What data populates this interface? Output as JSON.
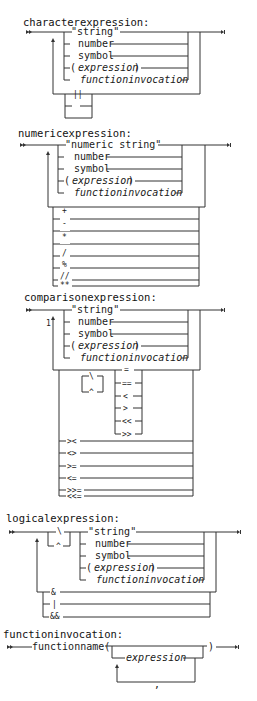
{
  "diagrams": {
    "character": {
      "title": "characterexpression:",
      "operands": [
        "\"string\"",
        "number",
        "symbol",
        "(",
        "expression",
        ")",
        "functioninvocation"
      ],
      "operators": [
        "||",
        "",
        ""
      ]
    },
    "numeric": {
      "title": "numericexpression:",
      "operands": [
        "\"numeric string\"",
        "number",
        "symbol",
        "(",
        "expression",
        ")",
        "functioninvocation"
      ],
      "operators": [
        "+",
        "-",
        "*",
        "/",
        "%",
        "//",
        "**"
      ]
    },
    "comparison": {
      "title": "comparisonexpression:",
      "note": "1",
      "operands": [
        "\"string\"",
        "number",
        "symbol",
        "(",
        "expression",
        ")",
        "functioninvocation"
      ],
      "negation": [
        "\\",
        "^"
      ],
      "operators_inner": [
        "=",
        "==",
        "<",
        ">",
        "<<",
        ">>"
      ],
      "operators_outer": [
        "><",
        "<>",
        ">=",
        "<=",
        ">>=",
        "<<="
      ]
    },
    "logical": {
      "title": "logicalexpression:",
      "negation": [
        "\\",
        "^"
      ],
      "operands": [
        "\"string\"",
        "number",
        "symbol",
        "(",
        "expression",
        ")",
        "functioninvocation"
      ],
      "operators": [
        "&",
        "|",
        "&&"
      ]
    },
    "functioninvocation": {
      "title": "functioninvocation:",
      "name": "functionname(",
      "argument": "expression",
      "separator": ",",
      "close": ")"
    }
  },
  "colors": {
    "line": "#333333",
    "text": "#1a1a1a",
    "background": "#ffffff"
  }
}
